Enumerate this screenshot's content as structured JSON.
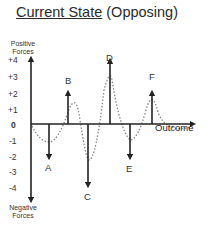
{
  "title": {
    "underlined": "Current State",
    "rest": " (Opposing)"
  },
  "axis": {
    "y_top_label_line1": "Positive",
    "y_top_label_line2": "Forces",
    "y_bottom_label_line1": "Negative",
    "y_bottom_label_line2": "Forces",
    "x_label": "Outcome",
    "ticks": [
      "+4",
      "+3",
      "+2",
      "+1",
      "0",
      "-1",
      "-2",
      "-3",
      "-4"
    ]
  },
  "forces": [
    {
      "label": "A",
      "value": -2,
      "direction": "down"
    },
    {
      "label": "B",
      "value": 2,
      "direction": "up"
    },
    {
      "label": "C",
      "value": -4,
      "direction": "down"
    },
    {
      "label": "D",
      "value": 4,
      "direction": "up"
    },
    {
      "label": "E",
      "value": -2,
      "direction": "down"
    },
    {
      "label": "F",
      "value": 2,
      "direction": "up"
    }
  ],
  "colors": {
    "line": "#222222",
    "dotted": "#888888"
  }
}
